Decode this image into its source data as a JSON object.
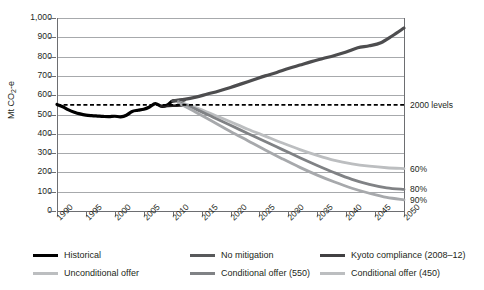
{
  "chart_data": {
    "type": "line",
    "title": "",
    "xlabel": "",
    "ylabel": "Mt CO2-e",
    "ylabel_parts": {
      "prefix": "Mt CO",
      "sub": "2",
      "suffix": "-e"
    },
    "xlim": [
      1990,
      2050
    ],
    "ylim": [
      0,
      1000
    ],
    "yticks": [
      0,
      100,
      200,
      300,
      400,
      500,
      600,
      700,
      800,
      900,
      1000
    ],
    "ytick_labels": [
      "0",
      "100",
      "200",
      "300",
      "400",
      "500",
      "600",
      "700",
      "800",
      "900",
      "1,000"
    ],
    "xticks": [
      1990,
      1995,
      2000,
      2005,
      2010,
      2015,
      2020,
      2025,
      2030,
      2035,
      2040,
      2045,
      2050
    ],
    "xtick_labels": [
      "1990",
      "1995",
      "2000",
      "2005",
      "2010",
      "2015",
      "2020",
      "2025",
      "2030",
      "2035",
      "2040",
      "2045",
      "2050"
    ],
    "grid": "horizontal",
    "legend_position": "bottom",
    "reference_line": {
      "label": "2000 levels",
      "value": 550,
      "style": "dashed",
      "color": "#000000"
    },
    "end_annotations": [
      {
        "label": "60%",
        "value": 220
      },
      {
        "label": "80%",
        "value": 112
      },
      {
        "label": "90%",
        "value": 58
      }
    ],
    "series": [
      {
        "name": "Historical",
        "color": "#000000",
        "width": 3.2,
        "points": [
          [
            1990,
            552
          ],
          [
            1991,
            540
          ],
          [
            1992,
            524
          ],
          [
            1993,
            512
          ],
          [
            1994,
            503
          ],
          [
            1995,
            497
          ],
          [
            1996,
            494
          ],
          [
            1997,
            492
          ],
          [
            1998,
            490
          ],
          [
            1999,
            489
          ],
          [
            2000,
            491
          ],
          [
            2001,
            488
          ],
          [
            2002,
            496
          ],
          [
            2003,
            516
          ],
          [
            2004,
            522
          ],
          [
            2005,
            527
          ],
          [
            2006,
            539
          ],
          [
            2007,
            556
          ],
          [
            2008,
            543
          ],
          [
            2009,
            548
          ],
          [
            2010,
            570
          ],
          [
            2011,
            572
          ],
          [
            2012,
            575
          ]
        ]
      },
      {
        "name": "No mitigation",
        "color": "#4d4d4f",
        "width": 3.2,
        "points": [
          [
            2010,
            570
          ],
          [
            2012,
            578
          ],
          [
            2014,
            590
          ],
          [
            2016,
            606
          ],
          [
            2018,
            622
          ],
          [
            2020,
            640
          ],
          [
            2022,
            660
          ],
          [
            2024,
            680
          ],
          [
            2026,
            700
          ],
          [
            2028,
            718
          ],
          [
            2030,
            738
          ],
          [
            2032,
            756
          ],
          [
            2034,
            774
          ],
          [
            2036,
            790
          ],
          [
            2038,
            806
          ],
          [
            2040,
            824
          ],
          [
            2042,
            846
          ],
          [
            2044,
            856
          ],
          [
            2046,
            872
          ],
          [
            2048,
            908
          ],
          [
            2050,
            948
          ]
        ]
      },
      {
        "name": "Kyoto compliance (2008-12)",
        "color": "#231f20",
        "width": 2.6,
        "points": [
          [
            2008,
            543
          ],
          [
            2010,
            545
          ],
          [
            2012,
            548
          ]
        ]
      },
      {
        "name": "Unconditional offer",
        "color": "#bcbec0",
        "width": 2.8,
        "points": [
          [
            2011,
            566
          ],
          [
            2014,
            536
          ],
          [
            2017,
            500
          ],
          [
            2020,
            462
          ],
          [
            2023,
            424
          ],
          [
            2026,
            388
          ],
          [
            2029,
            352
          ],
          [
            2032,
            318
          ],
          [
            2035,
            288
          ],
          [
            2038,
            262
          ],
          [
            2041,
            244
          ],
          [
            2044,
            232
          ],
          [
            2047,
            224
          ],
          [
            2050,
            220
          ]
        ]
      },
      {
        "name": "Conditional offer (550)",
        "color": "#808285",
        "width": 2.8,
        "points": [
          [
            2011,
            564
          ],
          [
            2014,
            528
          ],
          [
            2017,
            486
          ],
          [
            2020,
            444
          ],
          [
            2023,
            402
          ],
          [
            2026,
            360
          ],
          [
            2029,
            318
          ],
          [
            2032,
            276
          ],
          [
            2035,
            236
          ],
          [
            2038,
            198
          ],
          [
            2041,
            164
          ],
          [
            2044,
            138
          ],
          [
            2047,
            120
          ],
          [
            2050,
            112
          ]
        ]
      },
      {
        "name": "Conditional offer (450)",
        "color": "#a7a9ac",
        "width": 2.8,
        "points": [
          [
            2011,
            560
          ],
          [
            2014,
            512
          ],
          [
            2017,
            462
          ],
          [
            2020,
            412
          ],
          [
            2023,
            364
          ],
          [
            2026,
            316
          ],
          [
            2029,
            270
          ],
          [
            2032,
            226
          ],
          [
            2035,
            186
          ],
          [
            2038,
            150
          ],
          [
            2041,
            118
          ],
          [
            2044,
            92
          ],
          [
            2047,
            70
          ],
          [
            2050,
            58
          ]
        ]
      }
    ]
  },
  "legend": {
    "items": [
      {
        "label": "Historical",
        "color": "#000000"
      },
      {
        "label": "Unconditional offer",
        "color": "#bcbec0"
      },
      {
        "label": "No mitigation",
        "color": "#58595b"
      },
      {
        "label": "Conditional offer (550)",
        "color": "#808285"
      },
      {
        "label": "Kyoto compliance (2008–12)",
        "color": "#414042"
      },
      {
        "label": "Conditional offer (450)",
        "color": "#bcbec0"
      }
    ]
  }
}
